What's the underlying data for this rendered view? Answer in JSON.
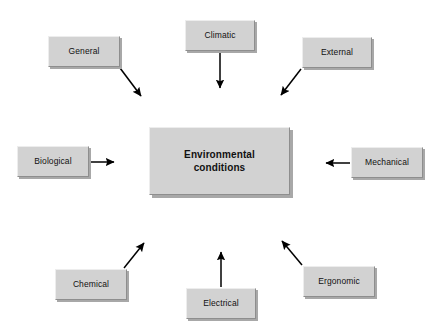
{
  "diagram": {
    "title_node": {
      "id": "environmental-conditions",
      "label": "Environmental\nconditions",
      "label_line1": "Environmental",
      "label_line2": "conditions",
      "x": 149,
      "y": 127,
      "width": 141,
      "height": 68
    },
    "background_color": "#ffffff",
    "node_fill_color": "#d2d2d2",
    "node_shadow_color": "#a8a8a8",
    "arrow_color": "#000000",
    "text_color": "#111111",
    "factors": [
      {
        "id": "general",
        "label": "General",
        "x": 48,
        "y": 36,
        "width": 72,
        "height": 31,
        "arrow": {
          "x1": 120,
          "y1": 68,
          "x2": 141,
          "y2": 96
        }
      },
      {
        "id": "climatic",
        "label": "Climatic",
        "x": 185,
        "y": 20,
        "width": 70,
        "height": 31,
        "arrow": {
          "x1": 220,
          "y1": 52,
          "x2": 220,
          "y2": 88
        }
      },
      {
        "id": "external",
        "label": "External",
        "x": 302,
        "y": 37,
        "width": 70,
        "height": 31,
        "arrow": {
          "x1": 301,
          "y1": 69,
          "x2": 281,
          "y2": 95
        }
      },
      {
        "id": "biological",
        "label": "Biological",
        "x": 17,
        "y": 146,
        "width": 72,
        "height": 31,
        "arrow": {
          "x1": 90,
          "y1": 162,
          "x2": 114,
          "y2": 162
        }
      },
      {
        "id": "mechanical",
        "label": "Mechanical",
        "x": 351,
        "y": 147,
        "width": 72,
        "height": 31,
        "arrow": {
          "x1": 350,
          "y1": 163,
          "x2": 326,
          "y2": 163
        }
      },
      {
        "id": "chemical",
        "label": "Chemical",
        "x": 55,
        "y": 269,
        "width": 72,
        "height": 31,
        "arrow": {
          "x1": 124,
          "y1": 268,
          "x2": 144,
          "y2": 243
        }
      },
      {
        "id": "electrical",
        "label": "Electrical",
        "x": 186,
        "y": 288,
        "width": 70,
        "height": 31,
        "arrow": {
          "x1": 221,
          "y1": 287,
          "x2": 221,
          "y2": 252
        }
      },
      {
        "id": "ergonomic",
        "label": "Ergonomic",
        "x": 303,
        "y": 266,
        "width": 72,
        "height": 31,
        "arrow": {
          "x1": 302,
          "y1": 265,
          "x2": 282,
          "y2": 241
        }
      }
    ]
  }
}
